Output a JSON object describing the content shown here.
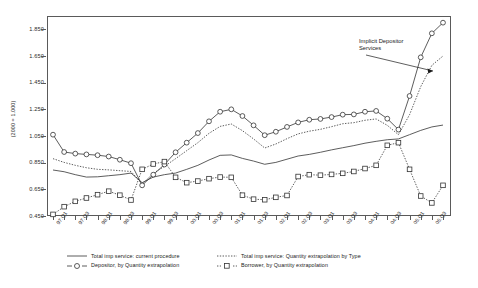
{
  "chart_data": {
    "type": "line",
    "title": "",
    "xlabel": "",
    "ylabel": "(2000 = 1.000)",
    "ylim": [
      0.45,
      1.95
    ],
    "yticks": [
      "1.850",
      "1.650",
      "1.450",
      "1.250",
      "1.050",
      "0.850",
      "0.650",
      "0.450"
    ],
    "ytick_values": [
      1.85,
      1.65,
      1.45,
      1.25,
      1.05,
      0.85,
      0.65,
      0.45
    ],
    "grid": false,
    "legend_position": "below-plot",
    "annotations": [
      {
        "text_line1": "Implicit Depositor",
        "text_line2": "Services",
        "points_to": "depositor-series-late-surge"
      }
    ],
    "categories": [
      "97:Q1",
      "97:Q2",
      "97:Q3",
      "97:Q4",
      "98:Q1",
      "98:Q2",
      "98:Q3",
      "98:Q4",
      "99:Q1",
      "99:Q2",
      "99:Q3",
      "99:Q4",
      "00:Q1",
      "00:Q2",
      "00:Q3",
      "00:Q4",
      "01:Q1",
      "01:Q2",
      "01:Q3",
      "01:Q4",
      "02:Q1",
      "02:Q2",
      "02:Q3",
      "02:Q4",
      "03:Q1",
      "03:Q2",
      "03:Q3",
      "03:Q4",
      "04:Q1",
      "04:Q2",
      "04:Q3",
      "04:Q4",
      "05:Q1",
      "05:Q2",
      "05:Q3",
      "05:Q4"
    ],
    "xtick_labels": [
      "97:Q1",
      "97:Q3",
      "98:Q1",
      "98:Q3",
      "99:Q1",
      "99:Q3",
      "00:Q1",
      "00:Q3",
      "01:Q1",
      "01:Q3",
      "02:Q1",
      "02:Q3",
      "03:Q1",
      "03:Q3",
      "04:Q1",
      "04:Q3",
      "05:Q1",
      "05:Q3"
    ],
    "series": [
      {
        "name": "Total imp service: current procedure",
        "style": "solid-line",
        "marker": "none",
        "color": "#333333",
        "values": [
          0.795,
          0.782,
          0.76,
          0.742,
          0.744,
          0.752,
          0.76,
          0.772,
          0.7,
          0.742,
          0.76,
          0.772,
          0.8,
          0.83,
          0.87,
          0.905,
          0.908,
          0.882,
          0.862,
          0.838,
          0.852,
          0.876,
          0.9,
          0.912,
          0.928,
          0.946,
          0.962,
          0.978,
          0.996,
          1.01,
          1.022,
          1.028,
          1.06,
          1.092,
          1.118,
          1.132
        ]
      },
      {
        "name": "Total imp service:  Quantity extrapolation by Type",
        "style": "dotted-line",
        "marker": "none",
        "color": "#333333",
        "values": [
          0.88,
          0.852,
          0.83,
          0.812,
          0.8,
          0.796,
          0.79,
          0.784,
          0.69,
          0.77,
          0.822,
          0.88,
          0.94,
          1.0,
          1.07,
          1.122,
          1.14,
          1.09,
          1.028,
          0.96,
          0.99,
          1.03,
          1.066,
          1.086,
          1.1,
          1.12,
          1.142,
          1.15,
          1.168,
          1.178,
          1.13,
          1.06,
          1.21,
          1.42,
          1.58,
          1.65
        ]
      },
      {
        "name": "Depositor, by Quantity extrapolation",
        "style": "solid-line",
        "marker": "circle",
        "color": "#333333",
        "values": [
          1.06,
          0.93,
          0.918,
          0.912,
          0.906,
          0.896,
          0.872,
          0.846,
          0.68,
          0.76,
          0.836,
          0.928,
          1.0,
          1.072,
          1.16,
          1.232,
          1.25,
          1.2,
          1.13,
          1.056,
          1.082,
          1.118,
          1.152,
          1.172,
          1.178,
          1.192,
          1.21,
          1.212,
          1.232,
          1.238,
          1.18,
          1.098,
          1.35,
          1.64,
          1.82,
          1.9
        ]
      },
      {
        "name": "Borrower, by Quantity extrapolation",
        "style": "dotted-line",
        "marker": "square",
        "color": "#333333",
        "values": [
          0.462,
          0.52,
          0.56,
          0.585,
          0.61,
          0.636,
          0.606,
          0.57,
          0.8,
          0.84,
          0.858,
          0.74,
          0.7,
          0.712,
          0.73,
          0.742,
          0.74,
          0.606,
          0.576,
          0.572,
          0.59,
          0.604,
          0.746,
          0.76,
          0.756,
          0.762,
          0.77,
          0.784,
          0.806,
          0.83,
          0.98,
          1.0,
          0.8,
          0.6,
          0.548,
          0.68
        ]
      }
    ]
  },
  "legend": {
    "items": [
      {
        "label": "Total imp service: current procedure",
        "key": "solid-line",
        "col": 0,
        "row": 0
      },
      {
        "label": "Total imp service:  Quantity extrapolation by Type",
        "key": "dotted-line",
        "col": 1,
        "row": 0
      },
      {
        "label": "Depositor, by Quantity extrapolation",
        "key": "solid-line-circle",
        "col": 0,
        "row": 1
      },
      {
        "label": "Borrower, by Quantity extrapolation",
        "key": "dotted-line-square",
        "col": 1,
        "row": 1
      }
    ]
  },
  "annotation": {
    "line1": "Implicit Depositor",
    "line2": "Services"
  },
  "colors": {
    "axis": "#5a5a5a",
    "ink": "#333333",
    "background": "#ffffff"
  }
}
